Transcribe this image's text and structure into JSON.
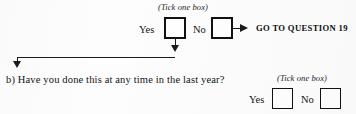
{
  "document": {
    "background_color": "#fdfdfd",
    "ink_color": "#1a1a1a"
  },
  "branch_question": {
    "tick_hint": "(Tick one box)",
    "options": [
      {
        "label": "Yes",
        "checked": false
      },
      {
        "label": "No",
        "checked": false
      }
    ],
    "routing": {
      "arrow": "arrow-right",
      "instruction": "GO TO QUESTION 19",
      "question_number": "19"
    },
    "yes_flow": {
      "arrow_down_1": "arrow-down",
      "arrow_down_2": "arrow-down"
    }
  },
  "sub_question": {
    "marker": "b)",
    "text": "Have you done this at any time in the last year?",
    "full_text": "b)  Have you done this at any time in the last year?",
    "tick_hint": "(Tick one box)",
    "options": [
      {
        "label": "Yes",
        "checked": false
      },
      {
        "label": "No",
        "checked": false
      }
    ]
  }
}
